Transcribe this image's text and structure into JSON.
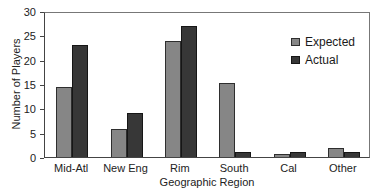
{
  "chart_data": {
    "type": "bar",
    "title": "",
    "xlabel": "Geographic Region",
    "ylabel": "Number of Players",
    "categories": [
      "Mid-Atl",
      "New Eng",
      "Rim",
      "South",
      "Cal",
      "Other"
    ],
    "series": [
      {
        "name": "Expected",
        "color": "#868686",
        "border_color": "#2e2e2e",
        "values": [
          14.3,
          5.7,
          23.8,
          15.2,
          0.7,
          1.8
        ]
      },
      {
        "name": "Actual",
        "color": "#373737",
        "border_color": "#161616",
        "values": [
          23,
          9,
          27,
          1,
          1,
          1
        ]
      }
    ],
    "ylim": [
      0,
      30
    ],
    "yticks": [
      0,
      5,
      10,
      15,
      20,
      25,
      30
    ],
    "grid": false,
    "legend_position": "top-right-inside",
    "frame_color": "#555555",
    "background_color": "#ffffff"
  }
}
